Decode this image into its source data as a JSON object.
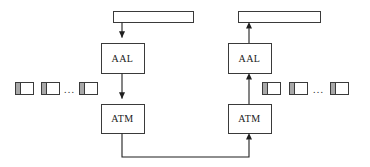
{
  "diagram": {
    "colors": {
      "stroke": "#3a3a3a",
      "arrow": "#1f1f1f",
      "cell_header_fill": "#a8a8a8",
      "cell_payload_fill": "#ffffff",
      "background": "#ffffff"
    },
    "left_stack": {
      "sdu_bar": {
        "label": ""
      },
      "aal": {
        "label": "AAL"
      },
      "atm": {
        "label": "ATM"
      },
      "cells": {
        "ellipsis": "...",
        "items": [
          {
            "label": ""
          },
          {
            "label": ""
          },
          {
            "label": ""
          }
        ]
      }
    },
    "right_stack": {
      "sdu_bar": {
        "label": ""
      },
      "aal": {
        "label": "AAL"
      },
      "atm": {
        "label": "ATM"
      },
      "cells": {
        "ellipsis": "...",
        "items": [
          {
            "label": ""
          },
          {
            "label": ""
          },
          {
            "label": ""
          }
        ]
      }
    }
  }
}
